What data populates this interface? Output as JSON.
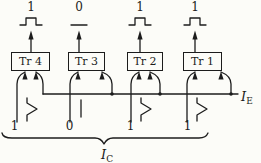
{
  "figure": {
    "background": "#fcfcf8",
    "ink": "#1c1c1c",
    "columns": [
      {
        "name": "tr4",
        "box_label": "Tr 4",
        "top_value": "1",
        "top_waveform": "pulse",
        "bottom_value": "1",
        "bottom_waveform": "pulse"
      },
      {
        "name": "tr3",
        "box_label": "Tr 3",
        "top_value": "0",
        "top_waveform": "flat",
        "bottom_value": "0",
        "bottom_waveform": "flat"
      },
      {
        "name": "tr2",
        "box_label": "Tr 2",
        "top_value": "1",
        "top_waveform": "pulse",
        "bottom_value": "1",
        "bottom_waveform": "pulse"
      },
      {
        "name": "tr1",
        "box_label": "Tr 1",
        "top_value": "1",
        "top_waveform": "pulse",
        "bottom_value": "1",
        "bottom_waveform": "pulse"
      }
    ],
    "emitter_line_label": {
      "symbol": "I",
      "subscript": "E"
    },
    "collector_brace_label": {
      "symbol": "I",
      "subscript": "C"
    }
  }
}
